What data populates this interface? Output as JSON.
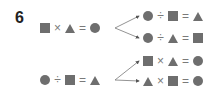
{
  "problem": {
    "number": "6",
    "shape_color": "#6e6e6e",
    "rows": [
      {
        "source": [
          "square",
          "×",
          "triangle",
          "=",
          "circle"
        ],
        "derived": [
          [
            "circle",
            "÷",
            "square",
            "=",
            "triangle"
          ],
          [
            "circle",
            "÷",
            "triangle",
            "=",
            "square"
          ]
        ]
      },
      {
        "source": [
          "circle",
          "÷",
          "square",
          "=",
          "triangle"
        ],
        "derived": [
          [
            "square",
            "×",
            "triangle",
            "=",
            "circle"
          ],
          [
            "triangle",
            "×",
            "square",
            "=",
            "circle"
          ]
        ]
      }
    ],
    "ops": {
      "times": "×",
      "divide": "÷",
      "equals": "="
    }
  }
}
